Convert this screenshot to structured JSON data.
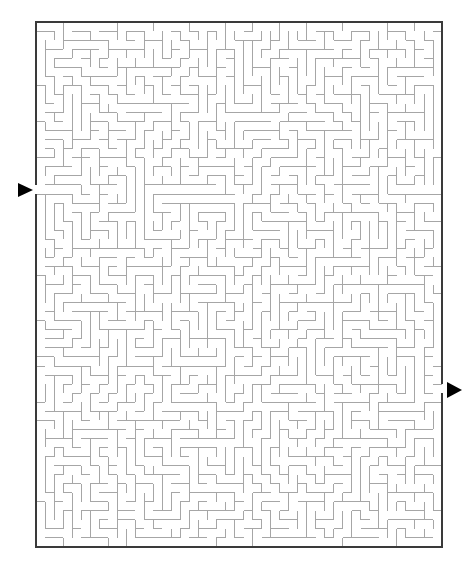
{
  "title": "Maze puzzle",
  "maze": {
    "left": 36,
    "top": 22,
    "width": 406,
    "height": 525,
    "cols": 45,
    "rows": 58,
    "seed": 1337,
    "wall_color": "#a6a6a6",
    "wall_width": 1,
    "border_color": "#3a3a3a",
    "border_width": 2,
    "entrance": {
      "side": "left",
      "row": 18,
      "label": "Start"
    },
    "exit": {
      "side": "right",
      "row": 40,
      "label": "Finish"
    }
  },
  "arrows": {
    "start": {
      "points": "18,183 33,190 18,197",
      "color": "#000000",
      "label": "start-arrow"
    },
    "finish": {
      "points": "447,382 462,390 447,398",
      "color": "#000000",
      "label": "finish-arrow"
    }
  }
}
